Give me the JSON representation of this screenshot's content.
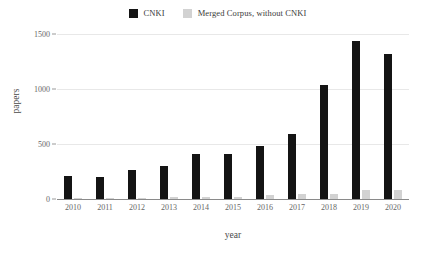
{
  "chart_data": {
    "type": "bar",
    "title": "",
    "xlabel": "year",
    "ylabel": "papers",
    "categories": [
      "2010",
      "2011",
      "2012",
      "2013",
      "2014",
      "2015",
      "2016",
      "2017",
      "2018",
      "2019",
      "2020"
    ],
    "series": [
      {
        "name": "CNKI",
        "color": "#141414",
        "values": [
          210,
          200,
          265,
          300,
          410,
          410,
          480,
          590,
          1040,
          1440,
          1320
        ]
      },
      {
        "name": "Merged Corpus, without CNKI",
        "color": "#d2d2d2",
        "values": [
          5,
          5,
          8,
          15,
          18,
          20,
          35,
          45,
          50,
          80,
          85
        ]
      }
    ],
    "ylim": [
      0,
      1500
    ],
    "yticks": [
      0,
      500,
      1000,
      1500
    ],
    "ytick_labels": [
      "0",
      "500",
      "1000",
      "1500"
    ],
    "grid": true,
    "legend_position": "top-center"
  }
}
